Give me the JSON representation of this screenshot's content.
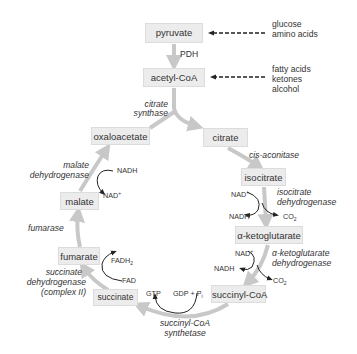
{
  "diagram": {
    "nodes": {
      "pyruvate": "pyruvate",
      "acetyl_coa": "acetyl-CoA",
      "citrate": "citrate",
      "isocitrate": "isocitrate",
      "a_ketoglutarate": "α-ketoglutarate",
      "succinyl_coa": "succinyl-CoA",
      "succinate": "succinate",
      "fumarate": "fumarate",
      "malate": "malate",
      "oxaloacetate": "oxaloacetate"
    },
    "inputs": {
      "pyruvate_sources": [
        "glucose",
        "amino acids"
      ],
      "acetyl_coa_sources": [
        "fatty acids",
        "ketones",
        "alcohol"
      ]
    },
    "enzymes": {
      "pdh": "PDH",
      "citrate_synthase": [
        "citrate",
        "synthase"
      ],
      "cis_aconitase": "cis-aconitase",
      "isocitrate_dehydrogenase": [
        "isocitrate",
        "dehydrogenase"
      ],
      "akg_dehydrogenase": [
        "α-ketoglutarate",
        "dehydrogenase"
      ],
      "succinyl_coa_synthetase": [
        "succinyl-CoA",
        "synthetase"
      ],
      "succinate_dehydrogenase": [
        "succinate",
        "dehydrogenase",
        "(complex II)"
      ],
      "fumarase": "fumarase",
      "malate_dehydrogenase": [
        "malate",
        "dehydrogenase"
      ]
    },
    "cofactors": {
      "idh_nad": "NAD",
      "idh_nadh": "NADH",
      "idh_co2": "CO",
      "akg_nad": "NAD",
      "akg_nadh": "NADH",
      "akg_co2": "CO",
      "scs_gtp": "GTP",
      "scs_gdp": "GDP + P",
      "sdh_fadh2": "FADH",
      "sdh_fad": "FAD",
      "mdh_nadh": "NADH",
      "mdh_nad": "NAD",
      "plus": "+",
      "sub2": "2",
      "sub_i": "i"
    },
    "colors": {
      "box_fill": "#ececec",
      "cycle_arrow": "#c8c8c8",
      "text": "#333333"
    }
  }
}
